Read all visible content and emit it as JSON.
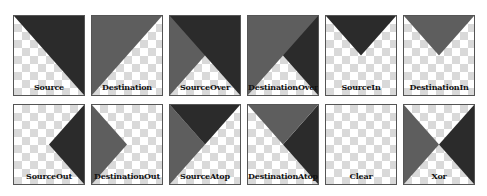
{
  "colors": {
    "source": "#2b2b2b",
    "destination": "#5e5e5e",
    "checker_light": "#ffffff",
    "checker_dark": "#d9d9d9",
    "border": "#555555"
  },
  "modes": [
    {
      "label": "Source",
      "id": "source"
    },
    {
      "label": "Destination",
      "id": "destination"
    },
    {
      "label": "SourceOver",
      "id": "source-over"
    },
    {
      "label": "DestinationOver",
      "id": "destination-over"
    },
    {
      "label": "SourceIn",
      "id": "source-in"
    },
    {
      "label": "DestinationIn",
      "id": "destination-in"
    },
    {
      "label": "SourceOut",
      "id": "source-out"
    },
    {
      "label": "DestinationOut",
      "id": "destination-out"
    },
    {
      "label": "SourceAtop",
      "id": "source-atop"
    },
    {
      "label": "DestinationAtop",
      "id": "destination-atop"
    },
    {
      "label": "Clear",
      "id": "clear"
    },
    {
      "label": "Xor",
      "id": "xor"
    }
  ]
}
